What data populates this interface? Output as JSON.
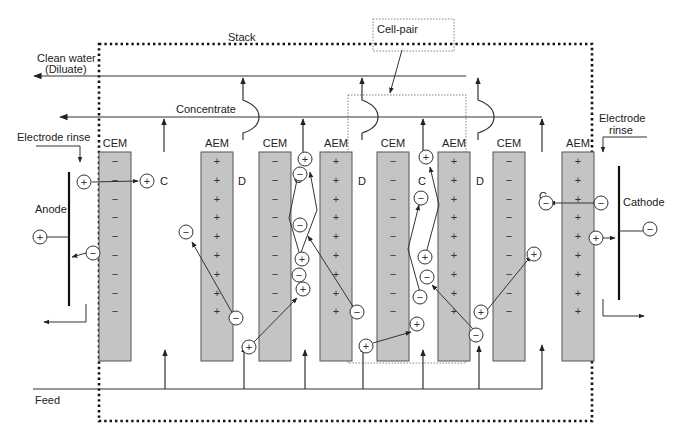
{
  "diagram": {
    "labels": {
      "stack": "Stack",
      "cell_pair": "Cell-pair",
      "clean_water_line1": "Clean water",
      "clean_water_line2": "(Diluate)",
      "concentrate": "Concentrate",
      "electrode_rinse_left": "Electrode rinse",
      "electrode_rinse_right_line1": "Electrode",
      "electrode_rinse_right_line2": "rinse",
      "anode": "Anode",
      "cathode": "Cathode",
      "feed": "Feed"
    },
    "membranes": [
      {
        "type": "CEM",
        "fixed_charge": "−"
      },
      {
        "type": "AEM",
        "fixed_charge": "+"
      },
      {
        "type": "CEM",
        "fixed_charge": "−"
      },
      {
        "type": "AEM",
        "fixed_charge": "+"
      },
      {
        "type": "CEM",
        "fixed_charge": "−"
      },
      {
        "type": "AEM",
        "fixed_charge": "+"
      },
      {
        "type": "CEM",
        "fixed_charge": "−"
      },
      {
        "type": "AEM",
        "fixed_charge": "+"
      }
    ],
    "compartments": [
      "C",
      "D",
      "C",
      "D",
      "C",
      "D",
      "C"
    ],
    "ion_symbols": {
      "cation": "+",
      "anion": "−"
    },
    "colors": {
      "membrane_fill": "#c4c4c4",
      "line": "#333333",
      "background": "#ffffff"
    }
  }
}
